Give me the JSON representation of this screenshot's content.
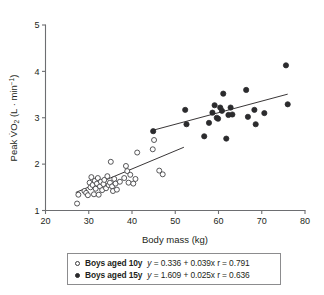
{
  "chart_data": {
    "type": "scatter",
    "title": "",
    "xlabel": "Body mass (kg)",
    "ylabel": "Peak VO2 (L · min⁻¹)",
    "ylabel_parts": {
      "prefix": "Peak V",
      "dot_over": "V",
      "subscript": "2",
      "oxygen": "O",
      "units": "(L · min",
      "units_sup": "−1",
      "units_close": ")"
    },
    "xlim": [
      20,
      80
    ],
    "ylim": [
      1,
      5
    ],
    "xticks": [
      20,
      30,
      40,
      50,
      60,
      70,
      80
    ],
    "yticks": [
      1,
      2,
      3,
      4,
      5
    ],
    "xtick_labels": [
      "20",
      "30",
      "40",
      "50",
      "60",
      "70",
      "80"
    ],
    "ytick_labels": [
      "1",
      "2",
      "3",
      "4",
      "5"
    ],
    "grid": false,
    "legend_position": "below-axes",
    "series": [
      {
        "name": "Boys aged 10y",
        "marker": "open-circle",
        "color": "#3a3a3c",
        "equation": "y = 0.336 + 0.039x",
        "slope": 0.039,
        "intercept": 0.336,
        "r": 0.791,
        "r_label": "r = 0.791",
        "fit_line": {
          "x0": 27.0,
          "x1": 52.0
        },
        "points": [
          [
            27.3,
            1.15
          ],
          [
            27.6,
            1.34
          ],
          [
            29.0,
            1.42
          ],
          [
            29.4,
            1.38
          ],
          [
            29.8,
            1.33
          ],
          [
            30.2,
            1.6
          ],
          [
            30.4,
            1.5
          ],
          [
            30.6,
            1.72
          ],
          [
            30.9,
            1.55
          ],
          [
            31.2,
            1.35
          ],
          [
            31.4,
            1.64
          ],
          [
            31.6,
            1.47
          ],
          [
            31.9,
            1.58
          ],
          [
            32.1,
            1.7
          ],
          [
            32.3,
            1.34
          ],
          [
            32.6,
            1.52
          ],
          [
            32.8,
            1.62
          ],
          [
            33.1,
            1.44
          ],
          [
            33.4,
            1.57
          ],
          [
            33.6,
            1.66
          ],
          [
            34.0,
            1.48
          ],
          [
            34.3,
            1.74
          ],
          [
            34.6,
            1.55
          ],
          [
            34.9,
            1.6
          ],
          [
            35.1,
            2.05
          ],
          [
            35.4,
            1.52
          ],
          [
            35.6,
            1.42
          ],
          [
            35.9,
            1.68
          ],
          [
            36.2,
            1.58
          ],
          [
            36.5,
            1.45
          ],
          [
            37.2,
            1.62
          ],
          [
            38.2,
            1.7
          ],
          [
            38.6,
            1.96
          ],
          [
            38.9,
            1.85
          ],
          [
            39.2,
            1.6
          ],
          [
            39.6,
            1.77
          ],
          [
            40.3,
            1.58
          ],
          [
            40.8,
            1.68
          ],
          [
            41.2,
            2.25
          ],
          [
            44.8,
            2.32
          ],
          [
            45.1,
            2.52
          ],
          [
            46.3,
            1.86
          ],
          [
            47.1,
            1.78
          ]
        ]
      },
      {
        "name": "Boys aged 15y",
        "marker": "filled-circle",
        "color": "#2b2b2d",
        "equation": "y = 1.609 + 0.025x",
        "slope": 0.025,
        "intercept": 1.609,
        "r": 0.636,
        "r_label": "r = 0.636",
        "fit_line": {
          "x0": 45.0,
          "x1": 76.0
        },
        "points": [
          [
            44.9,
            2.71
          ],
          [
            52.3,
            3.17
          ],
          [
            52.6,
            2.86
          ],
          [
            56.7,
            2.6
          ],
          [
            57.8,
            2.89
          ],
          [
            58.6,
            3.11
          ],
          [
            59.1,
            3.27
          ],
          [
            59.6,
            3.0
          ],
          [
            59.9,
            2.98
          ],
          [
            60.4,
            3.22
          ],
          [
            60.8,
            3.15
          ],
          [
            61.1,
            3.52
          ],
          [
            61.8,
            2.55
          ],
          [
            62.3,
            3.06
          ],
          [
            62.8,
            3.22
          ],
          [
            63.2,
            3.07
          ],
          [
            66.4,
            3.6
          ],
          [
            66.8,
            3.02
          ],
          [
            68.3,
            3.17
          ],
          [
            68.6,
            2.86
          ],
          [
            70.6,
            3.1
          ],
          [
            75.6,
            4.13
          ],
          [
            76.0,
            3.29
          ]
        ]
      }
    ]
  },
  "legend": {
    "rows": [
      {
        "marker": "open-circle",
        "label": "Boys aged 10y",
        "equation": "y = 0.336 + 0.039x",
        "r_label": "r = 0.791"
      },
      {
        "marker": "filled-circle",
        "label": "Boys aged 15y",
        "equation": "y = 1.609 + 0.025x",
        "r_label": "r = 0.636"
      }
    ]
  }
}
